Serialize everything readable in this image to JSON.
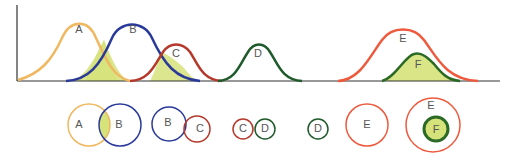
{
  "colors": {
    "A": "#f0b860",
    "B": "#2a3a9a",
    "C": "#b5382a",
    "D": "#1f5a2a",
    "E": "#ee5a3e",
    "F": "#2a6a25",
    "overlap": "#d6e27a",
    "axis": "#333333"
  },
  "curves": {
    "labels": [
      "A",
      "B",
      "C",
      "D",
      "E",
      "F"
    ]
  },
  "venn": {
    "pair1": [
      "A",
      "B"
    ],
    "pair2": [
      "B",
      "C"
    ],
    "pair3": [
      "C",
      "D"
    ],
    "single1": "D",
    "single2": "E",
    "nested": [
      "E",
      "F"
    ]
  }
}
